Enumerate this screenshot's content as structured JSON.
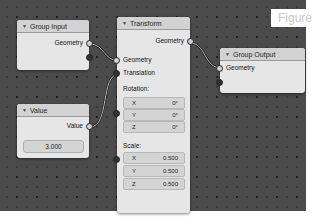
{
  "figure_label": "Figure",
  "nodes": {
    "group_input": {
      "title": "Group Input",
      "outputs": [
        "Geometry"
      ]
    },
    "value": {
      "title": "Value",
      "output_label": "Value",
      "value": "3.000"
    },
    "transform": {
      "title": "Transform",
      "output_label": "Geometry",
      "inputs": [
        "Geometry",
        "Translation"
      ],
      "rotation_label": "Rotation:",
      "rotation": [
        {
          "axis": "X",
          "value": "0°"
        },
        {
          "axis": "Y",
          "value": "0°"
        },
        {
          "axis": "Z",
          "value": "0°"
        }
      ],
      "scale_label": "Scale:",
      "scale": [
        {
          "axis": "X",
          "value": "0.500"
        },
        {
          "axis": "Y",
          "value": "0.500"
        },
        {
          "axis": "Z",
          "value": "0.500"
        }
      ]
    },
    "group_output": {
      "title": "Group Output",
      "inputs": [
        "Geometry"
      ]
    }
  },
  "colors": {
    "canvas": "#4b4b4b",
    "node_body": "#e6e6e6",
    "node_header": "#d2d2d2"
  }
}
